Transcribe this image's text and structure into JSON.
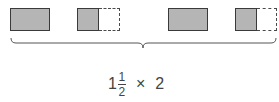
{
  "diagram": {
    "shapes": [
      {
        "type": "whole",
        "label": "1"
      },
      {
        "type": "half",
        "label": "1/2"
      },
      {
        "type": "whole",
        "label": "1"
      },
      {
        "type": "half",
        "label": "1/2"
      }
    ],
    "colors": {
      "fill": "#b5b5b5",
      "stroke": "#3a3a3a"
    },
    "expression": {
      "whole": "1",
      "numerator": "1",
      "denominator": "2",
      "operator": "×",
      "multiplier": "2"
    }
  }
}
